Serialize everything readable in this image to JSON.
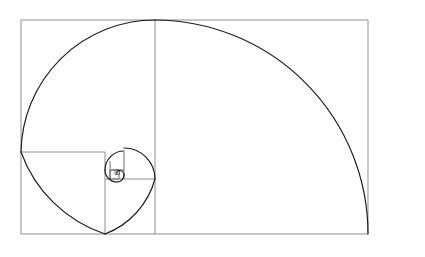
{
  "figure": {
    "title": "Fibonacci Spiral (Golden Ratio Rectangle)",
    "type": "geometric-diagram",
    "canvas": {
      "width": 425,
      "height": 257,
      "background": "#ffffff"
    },
    "colors": {
      "square_stroke": "#8f8f8f",
      "square_stroke_inner": "#6e6e6e",
      "spiral_stroke": "#1a1a1a",
      "background": "#ffffff"
    },
    "outer_rectangle": {
      "x": 21,
      "y": 20,
      "width": 347,
      "height": 214,
      "aspect_ratio": 1.621
    },
    "golden_ratio": 1.618,
    "fibonacci_sequence": [
      1,
      1,
      2,
      3,
      5,
      8,
      13,
      21,
      34,
      55,
      89,
      144,
      233
    ],
    "squares": [
      {
        "index": 0,
        "label": "square-1",
        "size": 214,
        "x": 21,
        "y": 20,
        "turn": "arc-from-top-mid-to-left-mid",
        "pixel_side": 214
      },
      {
        "index": 1,
        "label": "square-2",
        "size": 132,
        "x": 235,
        "y": 20,
        "turn": "arc-from-left-top-to-bottom",
        "pixel_side": 132
      },
      {
        "index": 2,
        "label": "square-3",
        "size": 82,
        "x": 153,
        "y": 152,
        "turn": "arc",
        "pixel_side": 82
      },
      {
        "index": 3,
        "label": "square-4",
        "size": 50,
        "x": 103,
        "y": 102,
        "turn": "arc",
        "pixel_side": 50
      },
      {
        "index": 4,
        "label": "square-5",
        "size": 31,
        "x": 103,
        "y": 152,
        "turn": "arc",
        "pixel_side": 31
      },
      {
        "index": 5,
        "label": "square-6",
        "size": 19,
        "x": 134,
        "y": 152,
        "turn": "arc",
        "pixel_side": 19
      },
      {
        "index": 6,
        "label": "square-7",
        "size": 12,
        "x": 134,
        "y": 171,
        "turn": "arc",
        "pixel_side": 12
      },
      {
        "index": 7,
        "label": "square-8",
        "size": 7,
        "x": 122,
        "y": 171,
        "turn": "arc",
        "pixel_side": 7
      }
    ],
    "divider_lines": [
      {
        "name": "vertical-main-divider",
        "x1": 155,
        "y1": 20,
        "x2": 155,
        "y2": 234
      },
      {
        "name": "horizontal-second-divider",
        "x1": 21,
        "y1": 152,
        "x2": 105,
        "y2": 152
      },
      {
        "name": "vertical-third-divider",
        "x1": 105,
        "y1": 152,
        "x2": 105,
        "y2": 234
      },
      {
        "name": "horizontal-fourth-divider",
        "x1": 105,
        "y1": 179,
        "x2": 155,
        "y2": 179
      }
    ],
    "spiral": {
      "description": "Quarter-circle arcs inscribed in each successive Fibonacci square, forming a logarithmic golden spiral",
      "arc_count": 9,
      "start": "outer left edge tangent",
      "end": "converges at spiral eye"
    },
    "caption": ""
  }
}
